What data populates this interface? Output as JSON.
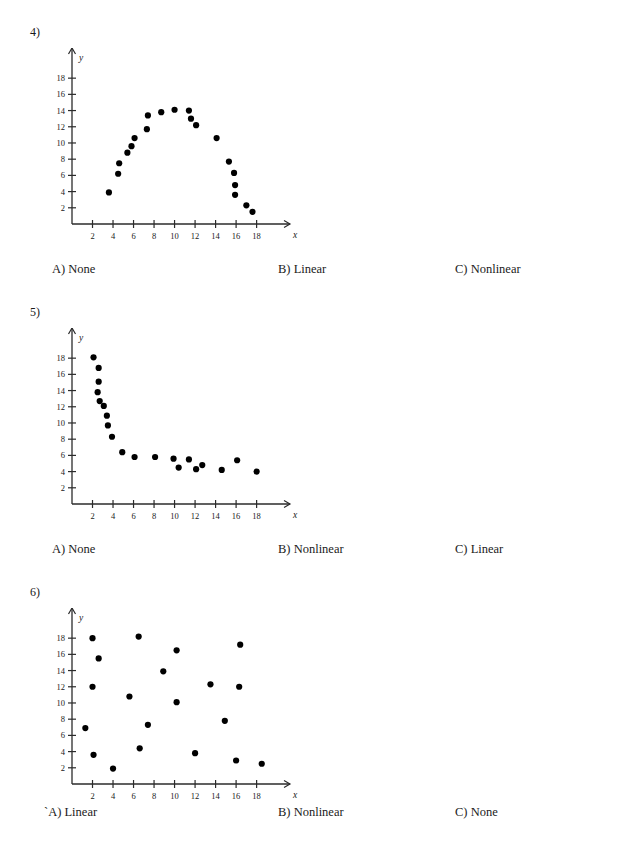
{
  "page": {
    "background": "#ffffff",
    "ink": "#1a1a1a",
    "point_color": "#000000"
  },
  "questions": [
    {
      "number": "4)",
      "options": [
        {
          "label": "A) None"
        },
        {
          "label": "B) Linear"
        },
        {
          "label": "C) Nonlinear"
        }
      ]
    },
    {
      "number": "5)",
      "options": [
        {
          "label": "A) None"
        },
        {
          "label": "B) Nonlinear"
        },
        {
          "label": "C) Linear"
        }
      ]
    },
    {
      "number": "6)",
      "options": [
        {
          "label": "`A) Linear"
        },
        {
          "label": "B) Nonlinear"
        },
        {
          "label": "C) None"
        }
      ]
    }
  ],
  "chart_data": [
    {
      "type": "scatter",
      "title": "",
      "xlabel": "x",
      "ylabel": "y",
      "xlim": [
        0,
        19.5
      ],
      "ylim": [
        0,
        19.5
      ],
      "xticks": [
        2,
        4,
        6,
        8,
        10,
        12,
        14,
        16,
        18
      ],
      "yticks": [
        2,
        4,
        6,
        8,
        10,
        12,
        14,
        16,
        18
      ],
      "grid": false,
      "legend": null,
      "points": [
        [
          3.6,
          3.9
        ],
        [
          4.5,
          6.2
        ],
        [
          4.6,
          7.5
        ],
        [
          5.4,
          8.8
        ],
        [
          5.8,
          9.6
        ],
        [
          6.1,
          10.6
        ],
        [
          7.3,
          11.7
        ],
        [
          7.4,
          13.4
        ],
        [
          8.7,
          13.8
        ],
        [
          10.0,
          14.1
        ],
        [
          11.4,
          14.0
        ],
        [
          11.6,
          13.0
        ],
        [
          12.1,
          12.2
        ],
        [
          14.1,
          10.6
        ],
        [
          15.3,
          7.7
        ],
        [
          15.8,
          6.3
        ],
        [
          15.9,
          4.8
        ],
        [
          15.9,
          3.6
        ],
        [
          17.0,
          2.3
        ],
        [
          17.6,
          1.5
        ]
      ]
    },
    {
      "type": "scatter",
      "title": "",
      "xlabel": "x",
      "ylabel": "y",
      "xlim": [
        0,
        19.5
      ],
      "ylim": [
        0,
        19.5
      ],
      "xticks": [
        2,
        4,
        6,
        8,
        10,
        12,
        14,
        16,
        18
      ],
      "yticks": [
        2,
        4,
        6,
        8,
        10,
        12,
        14,
        16,
        18
      ],
      "grid": false,
      "legend": null,
      "points": [
        [
          2.1,
          18.1
        ],
        [
          2.6,
          16.8
        ],
        [
          2.6,
          15.1
        ],
        [
          2.5,
          13.8
        ],
        [
          2.7,
          12.7
        ],
        [
          3.1,
          12.1
        ],
        [
          3.4,
          10.9
        ],
        [
          3.5,
          9.7
        ],
        [
          3.9,
          8.3
        ],
        [
          4.9,
          6.4
        ],
        [
          6.1,
          5.8
        ],
        [
          8.1,
          5.8
        ],
        [
          9.9,
          5.6
        ],
        [
          10.4,
          4.5
        ],
        [
          11.4,
          5.5
        ],
        [
          12.1,
          4.3
        ],
        [
          12.7,
          4.8
        ],
        [
          14.6,
          4.2
        ],
        [
          16.1,
          5.4
        ],
        [
          18.0,
          4.0
        ]
      ]
    },
    {
      "type": "scatter",
      "title": "",
      "xlabel": "x",
      "ylabel": "y",
      "xlim": [
        0,
        19.5
      ],
      "ylim": [
        0,
        19.5
      ],
      "xticks": [
        2,
        4,
        6,
        8,
        10,
        12,
        14,
        16,
        18
      ],
      "yticks": [
        2,
        4,
        6,
        8,
        10,
        12,
        14,
        16,
        18
      ],
      "grid": false,
      "legend": null,
      "points": [
        [
          1.3,
          6.9
        ],
        [
          2.0,
          18.0
        ],
        [
          2.0,
          12.0
        ],
        [
          2.1,
          3.6
        ],
        [
          2.6,
          15.5
        ],
        [
          4.0,
          1.9
        ],
        [
          5.6,
          10.8
        ],
        [
          6.5,
          18.2
        ],
        [
          6.6,
          4.4
        ],
        [
          7.4,
          7.3
        ],
        [
          8.9,
          13.9
        ],
        [
          10.2,
          16.5
        ],
        [
          10.2,
          10.1
        ],
        [
          12.0,
          3.8
        ],
        [
          13.5,
          12.3
        ],
        [
          14.9,
          7.8
        ],
        [
          16.0,
          2.9
        ],
        [
          16.4,
          17.2
        ],
        [
          16.3,
          12.0
        ],
        [
          18.5,
          2.5
        ]
      ]
    }
  ]
}
